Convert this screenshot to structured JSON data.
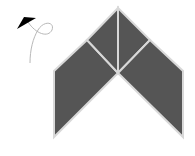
{
  "canvas": {
    "width": 195,
    "height": 156,
    "background": "#ffffff"
  },
  "shape": {
    "description": "chevron made of four tangram-like pieces",
    "fill_color": "#555555",
    "stroke_color": "#d8d8d8",
    "pieces": [
      {
        "name": "left-parallelogram",
        "points": "54,71 87,40 118,73 54,137"
      },
      {
        "name": "left-top-triangle",
        "points": "87,40 118,8 118,73"
      },
      {
        "name": "right-top-triangle",
        "points": "118,8 150,40 118,73"
      },
      {
        "name": "right-parallelogram",
        "points": "150,40 183,71 183,137 118,73"
      }
    ]
  },
  "turtle": {
    "icon": "turtle-arrow-icon",
    "color": "#000000",
    "points": "17,29 36,18 24,17",
    "tail_path": "M28,22 C36,34 48,38 52,30 C55,22 44,20 38,30 C33,38 30,50 30,63"
  }
}
